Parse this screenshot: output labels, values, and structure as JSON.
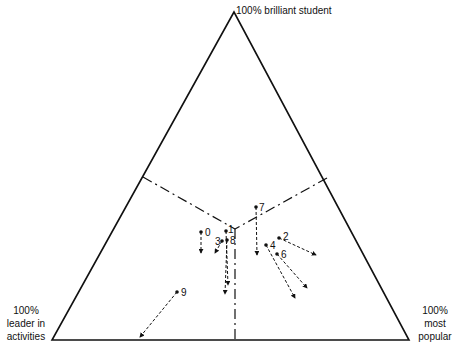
{
  "diagram": {
    "type": "ternary",
    "vertices": {
      "top": {
        "label": "100% brilliant student"
      },
      "left": {
        "label_lines": [
          "100%",
          "leader in",
          "activities"
        ]
      },
      "right": {
        "label_lines": [
          "100%",
          "most",
          "popular"
        ]
      }
    },
    "colors": {
      "line": "#111111",
      "background": "#ffffff"
    },
    "points": [
      {
        "id": "0",
        "x": 201,
        "y": 232,
        "lx": 205,
        "ly": 236,
        "ax": 201,
        "ay": 253
      },
      {
        "id": "1",
        "x": 226,
        "y": 231,
        "lx": 228,
        "ly": 233,
        "ax": 228,
        "ay": 285
      },
      {
        "id": "2",
        "x": 279,
        "y": 238,
        "lx": 283,
        "ly": 240,
        "ax": 316,
        "ay": 255
      },
      {
        "id": "3",
        "x": 222,
        "y": 241,
        "lx": 215,
        "ly": 245,
        "ax": 215,
        "ay": 253
      },
      {
        "id": "4",
        "x": 266,
        "y": 245,
        "lx": 270,
        "ly": 249,
        "ax": 295,
        "ay": 298
      },
      {
        "id": "6",
        "x": 277,
        "y": 254,
        "lx": 281,
        "ly": 258,
        "ax": 307,
        "ay": 288
      },
      {
        "id": "7",
        "x": 256,
        "y": 207,
        "lx": 259,
        "ly": 211,
        "ax": 257,
        "ay": 255
      },
      {
        "id": "8",
        "x": 227,
        "y": 240,
        "lx": 230,
        "ly": 244,
        "ax": 225,
        "ay": 294
      },
      {
        "id": "9",
        "x": 177,
        "y": 292,
        "lx": 181,
        "ly": 296,
        "ax": 140,
        "ay": 337
      }
    ]
  }
}
